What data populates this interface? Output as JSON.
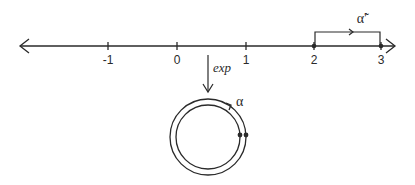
{
  "diagram": {
    "type": "covering-map illustration",
    "number_line": {
      "ticks": [
        {
          "value": -1,
          "label": "-1"
        },
        {
          "value": 0,
          "label": "0"
        },
        {
          "value": 1,
          "label": "1"
        },
        {
          "value": 2,
          "label": "2"
        },
        {
          "value": 3,
          "label": "3"
        }
      ],
      "left_arrow": true,
      "right_arrow": true
    },
    "lifted_path": {
      "label": "α̃′",
      "from": 2,
      "to": 3
    },
    "map_arrow": {
      "label": "exp"
    },
    "circle": {
      "path_label": "α",
      "loop": "double circle with base points"
    },
    "colors": {
      "stroke": "#2a2a2a",
      "background": "#ffffff"
    }
  }
}
